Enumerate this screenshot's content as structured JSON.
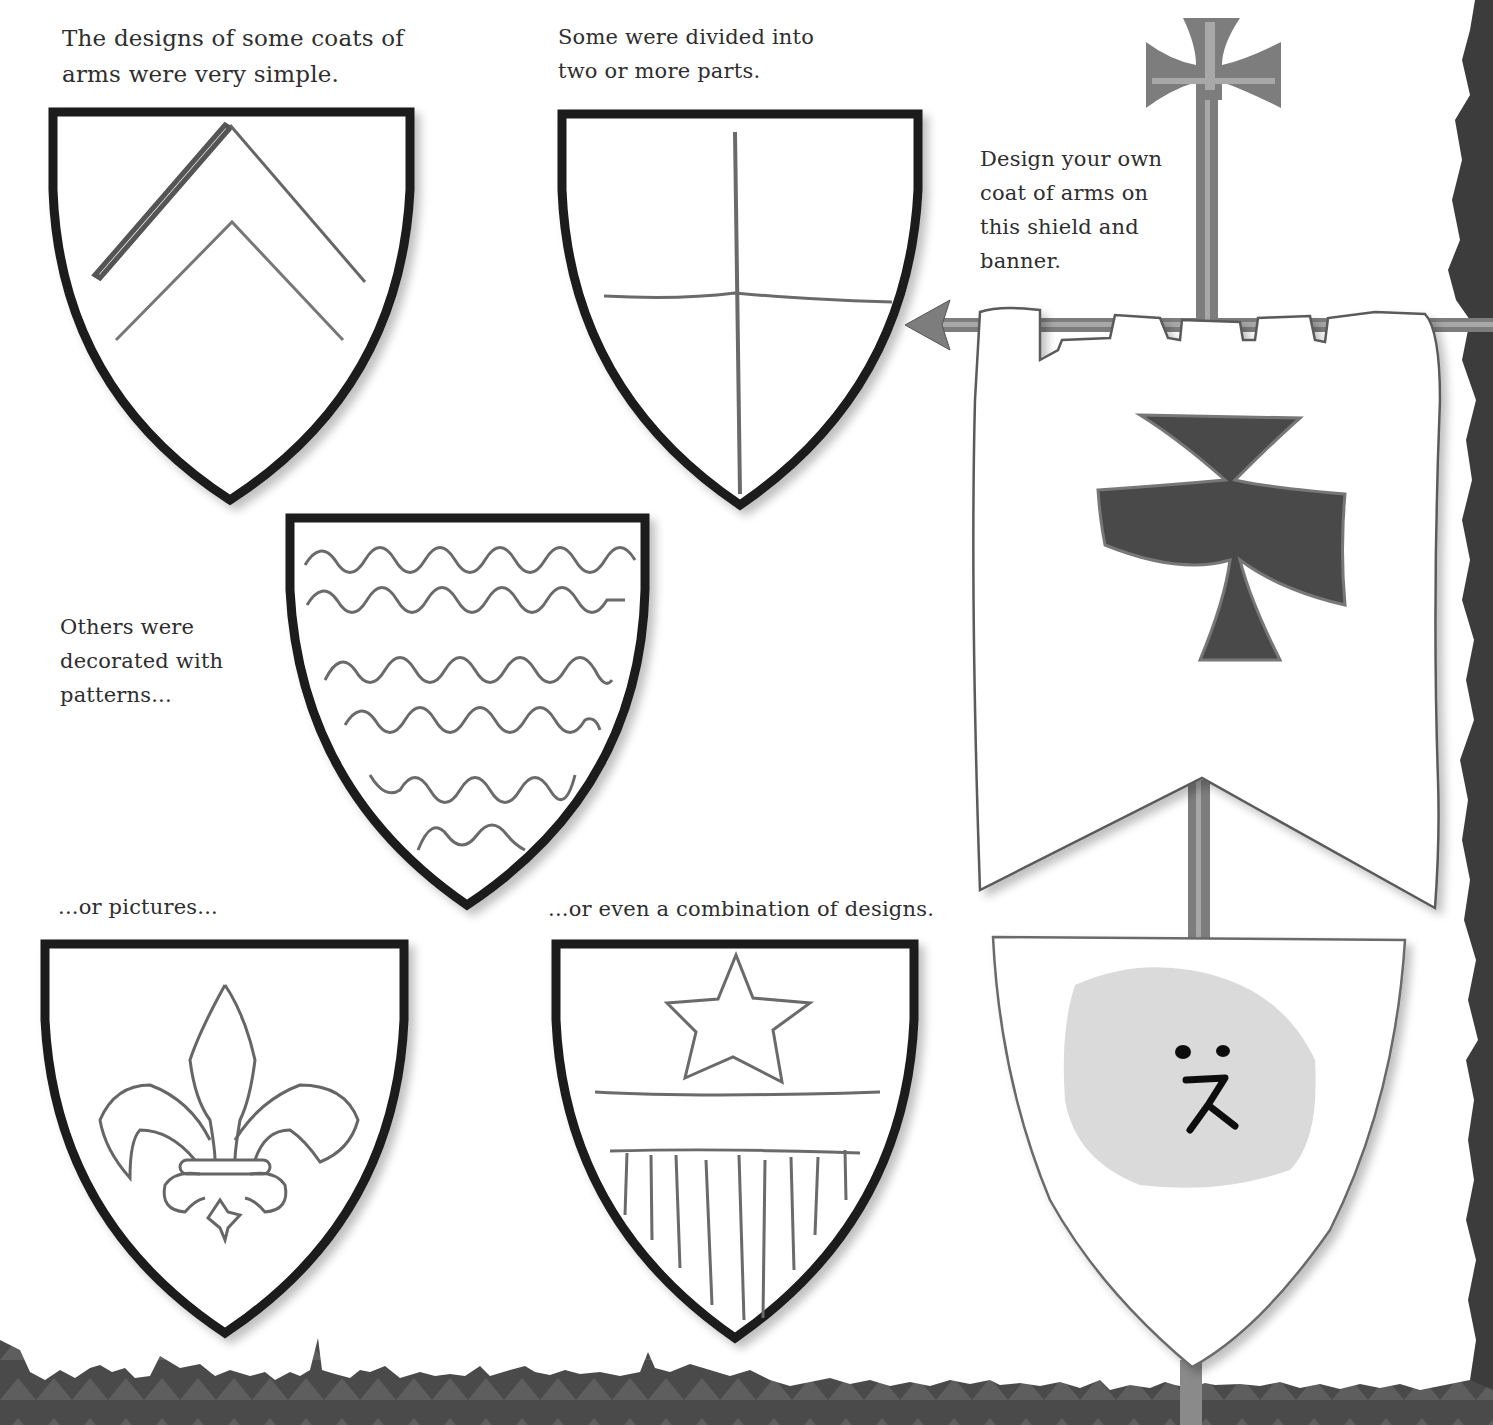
{
  "page": {
    "type": "activity-book-page",
    "topic": "Coats of arms"
  },
  "captions": {
    "simple": "The designs of some coats of\narms were very simple.",
    "divided": "Some were divided into\ntwo or more parts.",
    "own_design": "Design your own\ncoat of arms on\nthis shield and\nbanner.",
    "patterns": "Others were\ndecorated with\npatterns...",
    "pictures": "...or pictures...",
    "combination": "...or even a combination of designs."
  },
  "shields": [
    {
      "id": "simple",
      "design": "two chevrons"
    },
    {
      "id": "divided",
      "design": "quartered (cross division)"
    },
    {
      "id": "patterns",
      "design": "wavy lines"
    },
    {
      "id": "pictures",
      "design": "fleur-de-lis"
    },
    {
      "id": "combination",
      "design": "star, bar and vertical stripes"
    }
  ],
  "banner": {
    "emblem": "cross pattée (dark gray)",
    "pole_topper": "cross pattée finial",
    "pole_tip": "arrowhead"
  },
  "own_shield": {
    "emblem": "light-gray blob with face"
  },
  "colors": {
    "ink": "#1a1a1a",
    "pencil": "#6e6e6e",
    "pole": "#7d7d7d",
    "pole_light": "#a8a8a8",
    "emblem_dark": "#4a4a4a",
    "blob": "#d6d6d6",
    "border": "#3a3a3a"
  }
}
